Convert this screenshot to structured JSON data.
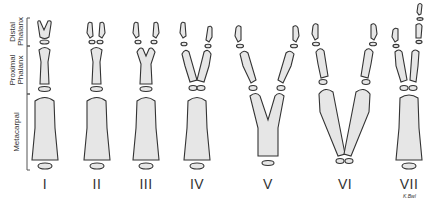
{
  "figure": {
    "regions": [
      {
        "id": "distal",
        "label_line1": "Distal",
        "label_line2": "Phalanx"
      },
      {
        "id": "proximal",
        "label_line1": "Proximal",
        "label_line2": "Phalanx"
      },
      {
        "id": "metacarpal",
        "label_line1": "Metacarpal",
        "label_line2": ""
      }
    ],
    "types": [
      {
        "numeral": "I",
        "x": 45
      },
      {
        "numeral": "II",
        "x": 97
      },
      {
        "numeral": "III",
        "x": 146
      },
      {
        "numeral": "IV",
        "x": 197
      },
      {
        "numeral": "V",
        "x": 268
      },
      {
        "numeral": "VI",
        "x": 345
      },
      {
        "numeral": "VII",
        "x": 409
      }
    ],
    "signature": "K.Bwl",
    "colors": {
      "bone_fill": "#e6e6e6",
      "bone_outline": "#333333",
      "background": "#ffffff"
    }
  }
}
